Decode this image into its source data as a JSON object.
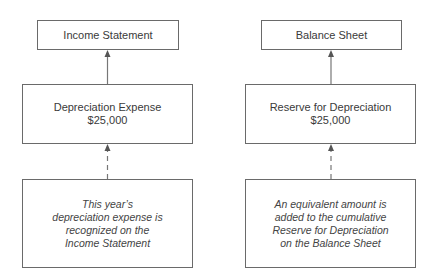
{
  "diagram": {
    "left_column": {
      "top_box": {
        "label": "Income Statement"
      },
      "middle_box": {
        "title": "Depreciation Expense",
        "amount": "$25,000"
      },
      "bottom_box": {
        "lines": [
          "This year’s",
          "depreciation expense is",
          "recognized on the",
          "Income Statement"
        ]
      }
    },
    "right_column": {
      "top_box": {
        "label": "Balance Sheet"
      },
      "middle_box": {
        "title": "Reserve for Depreciation",
        "amount": "$25,000"
      },
      "bottom_box": {
        "lines": [
          "An equivalent amount is",
          "added to the cumulative",
          "Reserve for Depreciation",
          "on the Balance Sheet"
        ]
      }
    },
    "connectors": [
      {
        "from": "Depreciation Expense",
        "to": "Income Statement",
        "style": "solid"
      },
      {
        "from": "This year's depreciation expense note",
        "to": "Depreciation Expense",
        "style": "dashed"
      },
      {
        "from": "Reserve for Depreciation",
        "to": "Balance Sheet",
        "style": "solid"
      },
      {
        "from": "An equivalent amount note",
        "to": "Reserve for Depreciation",
        "style": "dashed"
      }
    ],
    "colors": {
      "border": "#6a6a6a",
      "text": "#3a3a3a",
      "background": "#ffffff"
    }
  }
}
